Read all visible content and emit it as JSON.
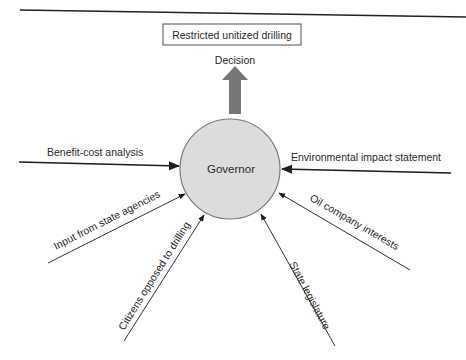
{
  "diagram": {
    "outcome": {
      "label": "Restricted unitized drilling",
      "caption": "Decision"
    },
    "center": {
      "label": "Governor",
      "fill": "#dcdcdc",
      "stroke": "#7a7a7a"
    },
    "decision_arrow_color": "#777777",
    "inputs": [
      {
        "id": "benefit-cost",
        "label": "Benefit-cost analysis"
      },
      {
        "id": "environmental",
        "label": "Environmental impact statement"
      },
      {
        "id": "state-agencies",
        "label": "Input from state agencies"
      },
      {
        "id": "oil-company",
        "label": "Oil company interests"
      },
      {
        "id": "citizens",
        "label": "Citizens opposed to drilling"
      },
      {
        "id": "state-legislature",
        "label": "State legislature"
      }
    ]
  }
}
